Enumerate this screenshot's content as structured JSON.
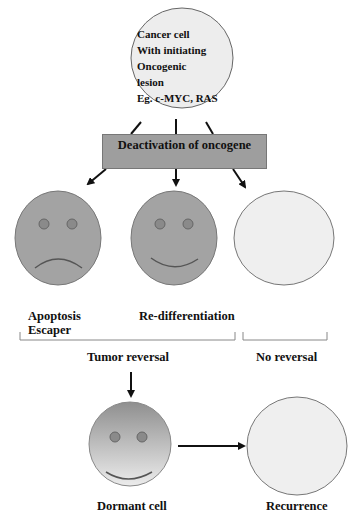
{
  "top_cell": {
    "lines": [
      "Cancer cell",
      "With initiating",
      "Oncogenic",
      "lesion",
      "Eg. c-MYC, RAS"
    ]
  },
  "deactivation_box": {
    "label": "Deactivation of oncogene",
    "color": "#9e9e9e"
  },
  "outcomes": [
    {
      "face": "sad",
      "label_lines": [
        "Apoptosis",
        "Escaper"
      ],
      "color": "#a3a3a3"
    },
    {
      "face": "happy",
      "label_lines": [
        "Re-differentiation"
      ],
      "color": "#a3a3a3"
    },
    {
      "face": "none",
      "label_lines": [],
      "color": "#efefef"
    }
  ],
  "groups": {
    "tumor_reversal": "Tumor reversal",
    "no_reversal": "No reversal"
  },
  "bottom": {
    "dormant_label": "Dormant cell",
    "recurrence_label": "Recurrence"
  }
}
